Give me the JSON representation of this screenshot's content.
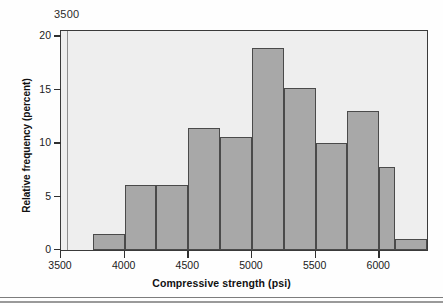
{
  "figure": {
    "stray_annotation": "3500",
    "background_color": "#eeeeee",
    "bar_fill_color": "#a8a8a8",
    "bar_edge_color": "#4a4a4a",
    "frame_color": "#3a3a3a"
  },
  "chart_data": {
    "type": "bar",
    "title": "",
    "xlabel": "Compressive strength (psi)",
    "ylabel": "Relative frequency (percent)",
    "xlim": [
      3500,
      6375
    ],
    "ylim": [
      0,
      20.5
    ],
    "xticks": [
      3500,
      4000,
      4500,
      5000,
      5500,
      6000
    ],
    "xtick_labels": [
      "3500",
      "4000",
      "4500",
      "5000",
      "5500",
      "6000"
    ],
    "yticks": [
      0,
      5,
      10,
      15,
      20
    ],
    "ytick_labels": [
      "0",
      "5",
      "10",
      "15",
      "20"
    ],
    "grid": false,
    "legend": null,
    "bin_width": 250,
    "bin_edges": [
      3750,
      4000,
      4250,
      4500,
      4750,
      5000,
      5250,
      5500,
      5750,
      6000,
      6125,
      6375
    ],
    "categories": [
      "3750-4000",
      "4000-4250",
      "4250-4500",
      "4500-4750",
      "4750-5000",
      "5000-5250",
      "5250-5500",
      "5500-5750",
      "5750-6000",
      "6000-6125",
      "6125-6375"
    ],
    "values": [
      1.5,
      6.1,
      6.1,
      11.4,
      10.6,
      18.9,
      15.2,
      10.0,
      13.0,
      7.8,
      1.0
    ],
    "bars": [
      {
        "x0": 3750,
        "x1": 4000,
        "value": 1.5
      },
      {
        "x0": 4000,
        "x1": 4250,
        "value": 6.1
      },
      {
        "x0": 4250,
        "x1": 4500,
        "value": 6.1
      },
      {
        "x0": 4500,
        "x1": 4750,
        "value": 11.4
      },
      {
        "x0": 4750,
        "x1": 5000,
        "value": 10.6
      },
      {
        "x0": 5000,
        "x1": 5250,
        "value": 18.9
      },
      {
        "x0": 5250,
        "x1": 5500,
        "value": 15.2
      },
      {
        "x0": 5500,
        "x1": 5750,
        "value": 10.0
      },
      {
        "x0": 5750,
        "x1": 6000,
        "value": 13.0
      },
      {
        "x0": 6000,
        "x1": 6125,
        "value": 7.8
      },
      {
        "x0": 6125,
        "x1": 6375,
        "value": 1.0
      }
    ]
  }
}
